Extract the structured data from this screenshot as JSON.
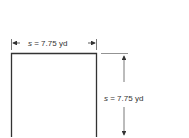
{
  "figure": {
    "shape": "square",
    "top_dimension": {
      "variable": "s",
      "text": " = 7.75 yd"
    },
    "right_dimension": {
      "variable": "s",
      "text": " = 7.75 yd"
    },
    "colors": {
      "stroke": "#333333",
      "dim_line": "#777777",
      "text": "#333333"
    }
  }
}
